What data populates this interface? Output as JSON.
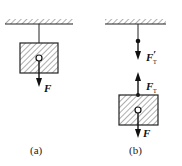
{
  "panels": [
    {
      "id": "a",
      "caption": "(a)",
      "forces": [
        {
          "symbol": "F",
          "subscript": "",
          "prime": "",
          "direction": "down"
        }
      ]
    },
    {
      "id": "b",
      "caption": "(b)",
      "forces": [
        {
          "symbol": "F",
          "subscript": "T",
          "prime": "′",
          "direction": "down"
        },
        {
          "symbol": "F",
          "subscript": "T",
          "prime": "",
          "direction": "up"
        },
        {
          "symbol": "F",
          "subscript": "",
          "prime": "",
          "direction": "down"
        }
      ]
    }
  ],
  "colors": {
    "ink": "#1a1a1a",
    "background": "#ffffff"
  }
}
